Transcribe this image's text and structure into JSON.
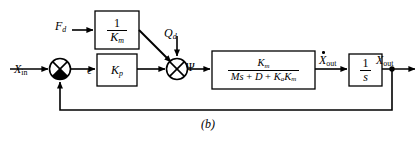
{
  "figure": {
    "caption": "(b)",
    "type": "control-system-block-diagram",
    "background_color": "#ffffff",
    "line_color": "#000000"
  },
  "signals": {
    "input": {
      "name": "X",
      "subscript": "in",
      "label": "X_in"
    },
    "error": {
      "name": "ϵ",
      "label": "ϵ"
    },
    "force_disturbance": {
      "name": "F",
      "subscript": "d",
      "label": "F_d"
    },
    "flow_disturbance": {
      "name": "Q",
      "subscript": "d",
      "label": "Q_d"
    },
    "psi": {
      "name": "Ψ",
      "label": "Ψ"
    },
    "velocity_out": {
      "name": "X",
      "subscript": "out",
      "accent": "dot",
      "label": "Ẋ_out"
    },
    "position_out": {
      "name": "X",
      "subscript": "out",
      "label": "X_out"
    }
  },
  "blocks": [
    {
      "id": "inv-km",
      "name": "inverse-motor-gain-block",
      "kind": "fraction",
      "numerator": "1",
      "denominator": "K",
      "denominator_subscript": "m",
      "label": "1 / K_m",
      "x": 95,
      "y": 11,
      "w": 44,
      "h": 38
    },
    {
      "id": "kp",
      "name": "proportional-gain-block",
      "kind": "gain",
      "gain": "K",
      "gain_subscript": "p",
      "label": "K_p",
      "x": 97,
      "y": 54,
      "w": 40,
      "h": 32
    },
    {
      "id": "plant",
      "name": "plant-transfer-function-block",
      "kind": "fraction",
      "numerator": "K",
      "numerator_subscript": "m",
      "denominator": "Ms + D + K",
      "denominator_parts": [
        "M",
        "s",
        " + ",
        "D",
        " + ",
        "K",
        "a",
        "K",
        "m"
      ],
      "label": "K_m / (Ms + D + K_a K_m)",
      "x": 212,
      "y": 51,
      "w": 103,
      "h": 38
    },
    {
      "id": "integrator",
      "name": "integrator-block",
      "kind": "fraction",
      "numerator": "1",
      "denominator": "s",
      "label": "1 / s",
      "x": 349,
      "y": 54,
      "w": 33,
      "h": 32
    }
  ],
  "summing_junctions": [
    {
      "id": "sum-1",
      "name": "error-summing-junction",
      "cx": 60,
      "cy": 69,
      "r": 11,
      "style": "crossed-circle-filled-bottom",
      "inputs": [
        "X_in",
        "feedback(X_out)"
      ],
      "output": "ϵ"
    },
    {
      "id": "sum-2",
      "name": "disturbance-summing-junction",
      "cx": 177,
      "cy": 69,
      "r": 11,
      "style": "crossed-circle-open",
      "inputs": [
        "K_p output",
        "F_d/K_m",
        "Q_d"
      ],
      "output": "Ψ"
    }
  ],
  "nodes": [
    {
      "id": "takeoff",
      "name": "output-takeoff-node",
      "cx": 392,
      "cy": 69,
      "r": 2.6
    }
  ],
  "feedback_path": {
    "name": "unity-feedback-path",
    "from": "X_out takeoff",
    "to": "error-summing-junction",
    "sign": "negative",
    "bottom_y": 110
  }
}
